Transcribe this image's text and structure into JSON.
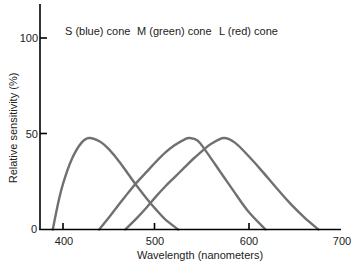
{
  "chart_data": {
    "type": "line",
    "title": "",
    "xlabel": "Wavelength (nanometers)",
    "ylabel": "Relative sensitivity (%)",
    "xlim": [
      375,
      700
    ],
    "ylim": [
      0,
      120
    ],
    "xticks": [
      400,
      500,
      600,
      700
    ],
    "yticks": [
      0,
      50,
      100
    ],
    "grid": false,
    "legend": "inline labels above peaks",
    "series": [
      {
        "name": "S (blue) cone",
        "peak_wavelength": 428,
        "x": [
          389,
          395,
          400,
          410,
          420,
          428,
          440,
          450,
          460,
          470,
          480,
          490,
          500,
          510,
          524
        ],
        "y": [
          0,
          30,
          50,
          78,
          95,
          100,
          96,
          87,
          75,
          61,
          47,
          34,
          22,
          11,
          0
        ]
      },
      {
        "name": "M (green) cone",
        "peak_wavelength": 536,
        "x": [
          439,
          450,
          460,
          470,
          480,
          490,
          500,
          510,
          520,
          530,
          536,
          545,
          555,
          570,
          585,
          600,
          618
        ],
        "y": [
          0,
          14,
          27,
          40,
          52,
          63,
          74,
          84,
          92,
          98,
          100,
          97,
          84,
          62,
          40,
          19,
          0
        ]
      },
      {
        "name": "L (red) cone",
        "peak_wavelength": 573,
        "x": [
          467,
          480,
          490,
          500,
          510,
          520,
          530,
          540,
          550,
          560,
          573,
          585,
          600,
          615,
          630,
          645,
          660,
          675
        ],
        "y": [
          0,
          13,
          24,
          36,
          47,
          57,
          67,
          77,
          86,
          94,
          100,
          95,
          80,
          63,
          45,
          28,
          13,
          0
        ]
      }
    ]
  },
  "labels": {
    "s_cone": "S (blue) cone",
    "m_cone": "M (green) cone",
    "l_cone": "L (red) cone",
    "xlabel": "Wavelength (nanometers)",
    "ylabel": "Relative sensitivity (%)",
    "xtick_400": "400",
    "xtick_500": "500",
    "xtick_600": "600",
    "xtick_700": "700",
    "ytick_0": "0",
    "ytick_50": "50",
    "ytick_100": "100"
  },
  "colors": {
    "curve": "#707070",
    "axis": "#000000"
  }
}
